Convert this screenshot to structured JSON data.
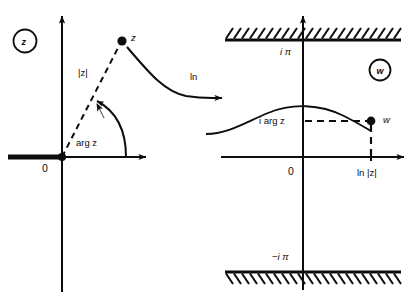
{
  "figure": {
    "background": "#ffffff",
    "ink": "#0d0d0d"
  },
  "left_panel": {
    "badge": "z",
    "origin_label": "0",
    "point_label": "z",
    "modulus_label": "|z|",
    "argument_label": "arg z",
    "branch_cut": "negative real axis ray"
  },
  "map_arrow": {
    "label": "ln"
  },
  "right_panel": {
    "badge": "w",
    "origin_label": "0",
    "point_label": "w",
    "upper_boundary_label": "i π",
    "lower_boundary_label": "−i π",
    "imaginary_part_label": "i arg z",
    "real_part_label": "ln |z|"
  }
}
